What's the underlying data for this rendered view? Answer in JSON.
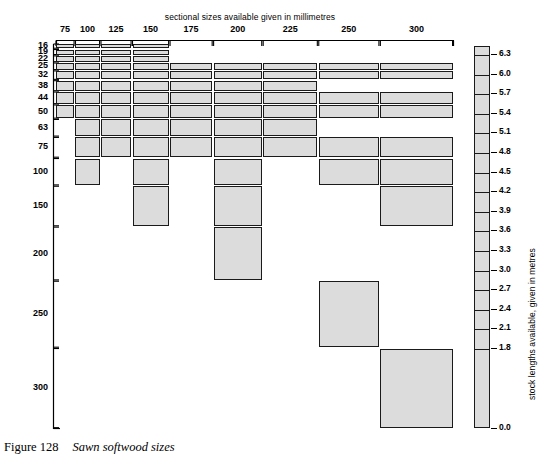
{
  "figure": {
    "caption_number": "Figure 128",
    "caption_text": "Sawn softwood sizes",
    "top_axis_title": "sectional sizes available given in millimetres",
    "scale_axis_title": "stock lengths available, given in metres"
  },
  "chart_data": {
    "type": "heatmap",
    "title": "Sawn softwood sizes",
    "xlabel": "sectional sizes available given in millimetres",
    "ylabel": "",
    "legend_label": "stock lengths available, given in metres",
    "grid": false,
    "legend_position": "right",
    "categories": [
      "75",
      "100",
      "125",
      "150",
      "175",
      "200",
      "225",
      "250",
      "300"
    ],
    "x": [
      75,
      100,
      125,
      150,
      175,
      200,
      225,
      250,
      300
    ],
    "y": [
      16,
      19,
      22,
      25,
      32,
      38,
      44,
      50,
      63,
      75,
      100,
      150,
      200,
      250,
      300
    ],
    "yticklabels": [
      "16",
      "19",
      "22",
      "25",
      "32",
      "38",
      "44",
      "50",
      "63",
      "75",
      "100",
      "150",
      "200",
      "250",
      "300"
    ],
    "legend_ticks": [
      "6.3",
      "6.0",
      "5.7",
      "5.4",
      "5.1",
      "4.8",
      "4.5",
      "4.2",
      "3.9",
      "3.6",
      "3.3",
      "3.0",
      "2.7",
      "2.4",
      "2.1",
      "1.8",
      "0.0"
    ],
    "legend_values": [
      6.3,
      6.0,
      5.7,
      5.4,
      5.1,
      4.8,
      4.5,
      4.2,
      3.9,
      3.6,
      3.3,
      3.0,
      2.7,
      2.4,
      2.1,
      1.8,
      0.0
    ],
    "fill_color": "#dcdcdc",
    "edge_color": "#1a1a1a",
    "cells": [
      {
        "thickness": 16,
        "widths": [
          75,
          100,
          125,
          150
        ]
      },
      {
        "thickness": 19,
        "widths": [
          75,
          100,
          125,
          150
        ]
      },
      {
        "thickness": 22,
        "widths": [
          75,
          100,
          125,
          150
        ]
      },
      {
        "thickness": 25,
        "widths": [
          75,
          100,
          125,
          150,
          175,
          200,
          225,
          250,
          300
        ]
      },
      {
        "thickness": 32,
        "widths": [
          75,
          100,
          125,
          150,
          175,
          200,
          225,
          250,
          300
        ]
      },
      {
        "thickness": 38,
        "widths": [
          75,
          100,
          125,
          150,
          175,
          200,
          225
        ]
      },
      {
        "thickness": 44,
        "widths": [
          75,
          100,
          125,
          150,
          175,
          200,
          225,
          250,
          300
        ]
      },
      {
        "thickness": 50,
        "widths": [
          75,
          100,
          125,
          150,
          175,
          200,
          225,
          250,
          300
        ]
      },
      {
        "thickness": 63,
        "widths": [
          100,
          125,
          150,
          175,
          200,
          225
        ]
      },
      {
        "thickness": 75,
        "widths": [
          100,
          125,
          150,
          175,
          200,
          225,
          250,
          300
        ]
      },
      {
        "thickness": 100,
        "widths": [
          100,
          150,
          200,
          250,
          300
        ]
      },
      {
        "thickness": 150,
        "widths": [
          150,
          200,
          300
        ]
      },
      {
        "thickness": 200,
        "widths": [
          200
        ]
      },
      {
        "thickness": 250,
        "widths": [
          250
        ]
      },
      {
        "thickness": 300,
        "widths": [
          300
        ]
      }
    ]
  },
  "x_labels": [
    {
      "value": "75"
    },
    {
      "value": "100"
    },
    {
      "value": "125"
    },
    {
      "value": "150"
    },
    {
      "value": "175"
    },
    {
      "value": "200"
    },
    {
      "value": "225"
    },
    {
      "value": "250"
    },
    {
      "value": "300"
    }
  ],
  "y_labels": [
    {
      "value": "16"
    },
    {
      "value": "19"
    },
    {
      "value": "22"
    },
    {
      "value": "25"
    },
    {
      "value": "32"
    },
    {
      "value": "38"
    },
    {
      "value": "44"
    },
    {
      "value": "50"
    },
    {
      "value": "63"
    },
    {
      "value": "75"
    },
    {
      "value": "100"
    },
    {
      "value": "150"
    },
    {
      "value": "200"
    },
    {
      "value": "250"
    },
    {
      "value": "300"
    }
  ],
  "scale_labels": [
    {
      "value": "6.3"
    },
    {
      "value": "6.0"
    },
    {
      "value": "5.7"
    },
    {
      "value": "5.4"
    },
    {
      "value": "5.1"
    },
    {
      "value": "4.8"
    },
    {
      "value": "4.5"
    },
    {
      "value": "4.2"
    },
    {
      "value": "3.9"
    },
    {
      "value": "3.6"
    },
    {
      "value": "3.3"
    },
    {
      "value": "3.0"
    },
    {
      "value": "2.7"
    },
    {
      "value": "2.4"
    },
    {
      "value": "2.1"
    },
    {
      "value": "1.8"
    },
    {
      "value": "0.0"
    }
  ]
}
